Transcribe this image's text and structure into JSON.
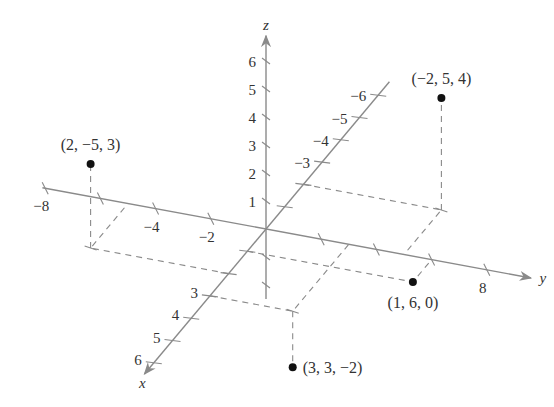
{
  "figure": {
    "type": "3d-coordinate-system-plot",
    "origin_px": [
      266,
      229
    ],
    "unit_vectors_px": {
      "x": [
        -18.7,
        22.3
      ],
      "y": [
        27.6,
        5.1
      ],
      "z": [
        0,
        -28
      ]
    },
    "colors": {
      "axis": "#8a8a8a",
      "point": "#111111",
      "text": "#333333"
    },
    "axes": {
      "x": {
        "label": "x",
        "ticks": [
          {
            "v": 1,
            "label": ""
          },
          {
            "v": 2,
            "label": ""
          },
          {
            "v": 3,
            "label": "3"
          },
          {
            "v": 4,
            "label": "4"
          },
          {
            "v": 5,
            "label": "5"
          },
          {
            "v": 6,
            "label": "6"
          },
          {
            "v": -1,
            "label": ""
          },
          {
            "v": -2,
            "label": ""
          },
          {
            "v": -3,
            "label": "−3"
          },
          {
            "v": -4,
            "label": "−4"
          },
          {
            "v": -5,
            "label": "−5"
          },
          {
            "v": -6,
            "label": "−6"
          }
        ],
        "range": [
          -6.6,
          6.5
        ]
      },
      "y": {
        "label": "y",
        "ticks": [
          {
            "v": -8,
            "label": "−8"
          },
          {
            "v": -6,
            "label": ""
          },
          {
            "v": -4,
            "label": "−4"
          },
          {
            "v": -2,
            "label": "−2"
          },
          {
            "v": 2,
            "label": ""
          },
          {
            "v": 4,
            "label": ""
          },
          {
            "v": 6,
            "label": ""
          },
          {
            "v": 8,
            "label": "8"
          }
        ],
        "range": [
          -8.1,
          9.6
        ]
      },
      "z": {
        "label": "z",
        "ticks": [
          {
            "v": 1,
            "label": "1"
          },
          {
            "v": 2,
            "label": "2"
          },
          {
            "v": 3,
            "label": "3"
          },
          {
            "v": 4,
            "label": "4"
          },
          {
            "v": 5,
            "label": "5"
          },
          {
            "v": 6,
            "label": "6"
          },
          {
            "v": -1,
            "label": ""
          },
          {
            "v": -2,
            "label": ""
          }
        ],
        "range": [
          -2.5,
          6.9
        ]
      }
    },
    "points": [
      {
        "coords": [
          -2,
          5,
          4
        ],
        "label": "(−2, 5, 4)"
      },
      {
        "coords": [
          2,
          -5,
          3
        ],
        "label": "(2, −5, 3)"
      },
      {
        "coords": [
          1,
          6,
          0
        ],
        "label": "(1, 6, 0)"
      },
      {
        "coords": [
          3,
          3,
          -2
        ],
        "label": "(3, 3, −2)"
      }
    ]
  },
  "chart_data": {
    "type": "scatter",
    "title": "",
    "xlabel": "x",
    "ylabel": "y",
    "zlabel": "z",
    "projection": "3d",
    "series": [
      {
        "name": "points",
        "values": [
          {
            "x": -2,
            "y": 5,
            "z": 4,
            "label": "(−2, 5, 4)"
          },
          {
            "x": 2,
            "y": -5,
            "z": 3,
            "label": "(2, −5, 3)"
          },
          {
            "x": 1,
            "y": 6,
            "z": 0,
            "label": "(1, 6, 0)"
          },
          {
            "x": 3,
            "y": 3,
            "z": -2,
            "label": "(3, 3, −2)"
          }
        ]
      }
    ],
    "x_ticks": [
      "3",
      "4",
      "5",
      "6",
      "−3",
      "−4",
      "−5",
      "−6"
    ],
    "y_ticks": [
      "−8",
      "−4",
      "−2",
      "8"
    ],
    "z_ticks": [
      "1",
      "2",
      "3",
      "4",
      "5",
      "6"
    ],
    "grid": false,
    "legend": null
  }
}
